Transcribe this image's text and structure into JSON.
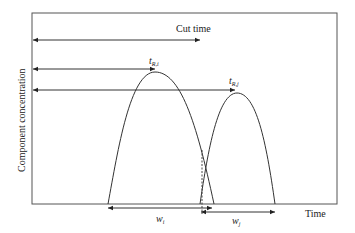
{
  "diagram": {
    "title": "",
    "y_axis_label": "Component concentration",
    "x_axis_label": "Time",
    "annotations": {
      "cut_time": "Cut time",
      "retention_i": {
        "main": "t",
        "sub": "R,i"
      },
      "retention_j": {
        "main": "t",
        "sub": "R,j"
      },
      "width_i": {
        "main": "w",
        "sub": "i"
      },
      "width_j": {
        "main": "w",
        "sub": "j"
      }
    },
    "elements": [
      {
        "id": "peak-i",
        "type": "curve",
        "description": "Elution peak of component i (parabolic)"
      },
      {
        "id": "peak-j",
        "type": "curve",
        "description": "Elution peak of component j (parabolic), overlapping peak i"
      },
      {
        "id": "cut-time-arrow",
        "type": "arrow",
        "description": "Horizontal arrow from axis to cut time"
      },
      {
        "id": "retention-i-arrow",
        "type": "arrow",
        "description": "Arrow from axis to peak i apex"
      },
      {
        "id": "retention-j-arrow",
        "type": "arrow",
        "description": "Arrow from axis to peak j apex"
      },
      {
        "id": "cut-line",
        "type": "dashed-line",
        "description": "Vertical dashed line at the cut time"
      },
      {
        "id": "width-i-arrow",
        "type": "double-arrow",
        "description": "Base width of peak i"
      },
      {
        "id": "width-j-arrow",
        "type": "double-arrow",
        "description": "Base width of peak j"
      }
    ],
    "colors": {
      "line": "#333333",
      "frame": "#555555",
      "background": "#ffffff"
    }
  }
}
